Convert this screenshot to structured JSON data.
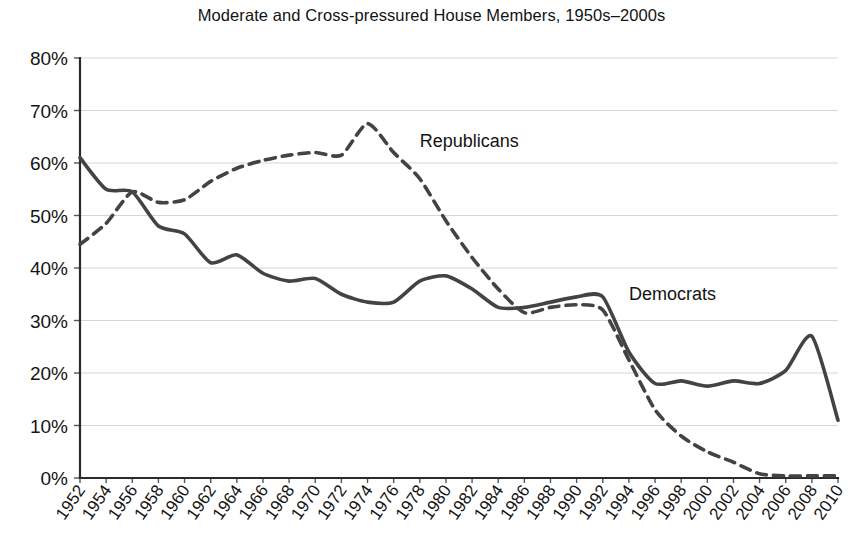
{
  "chart_data": {
    "type": "line",
    "title": "Moderate and Cross-pressured House Members, 1950s–2000s",
    "xlabel": "",
    "ylabel": "",
    "ylim": [
      0,
      80
    ],
    "ytick_labels": [
      "0%",
      "10%",
      "20%",
      "30%",
      "40%",
      "50%",
      "60%",
      "70%",
      "80%"
    ],
    "ytick_values": [
      0,
      10,
      20,
      30,
      40,
      50,
      60,
      70,
      80
    ],
    "grid": true,
    "legend_position": "inline-annotation",
    "x": [
      1952,
      1954,
      1956,
      1958,
      1960,
      1962,
      1964,
      1966,
      1968,
      1970,
      1972,
      1974,
      1976,
      1978,
      1980,
      1982,
      1984,
      1986,
      1988,
      1990,
      1992,
      1994,
      1996,
      1998,
      2000,
      2002,
      2004,
      2006,
      2008,
      2010
    ],
    "xtick_labels": [
      "1952",
      "1954",
      "1956",
      "1958",
      "1960",
      "1962",
      "1964",
      "1966",
      "1968",
      "1970",
      "1972",
      "1974",
      "1976",
      "1978",
      "1980",
      "1982",
      "1984",
      "1986",
      "1988",
      "1990",
      "1992",
      "1994",
      "1996",
      "1998",
      "2000",
      "2002",
      "2004",
      "2006",
      "2008",
      "2010"
    ],
    "series": [
      {
        "name": "Democrats",
        "style": "solid",
        "color": "#434343",
        "label_x": 1994,
        "label_y": 34,
        "values": [
          61,
          55,
          54.5,
          48,
          46.5,
          41,
          42.5,
          39,
          37.5,
          38,
          35,
          33.5,
          33.5,
          37.5,
          38.5,
          36,
          32.5,
          32.5,
          33.5,
          34.5,
          34.5,
          24,
          18,
          18.5,
          17.5,
          18.5,
          18,
          20.5,
          27,
          11
        ]
      },
      {
        "name": "Republicans",
        "style": "dashed",
        "color": "#434343",
        "label_x": 1978,
        "label_y": 63,
        "values": [
          44.5,
          48.5,
          54.5,
          52.5,
          53,
          56.5,
          59,
          60.5,
          61.5,
          62,
          61.5,
          67.5,
          62,
          57,
          49,
          42,
          36,
          31.5,
          32.5,
          33,
          32,
          22.5,
          13,
          8,
          5,
          3,
          0.8,
          0.4,
          0.4,
          0.4
        ]
      }
    ],
    "annotations": [
      {
        "text": "Republicans",
        "x": 1978,
        "y": 63
      },
      {
        "text": "Democrats",
        "x": 1994,
        "y": 34
      }
    ]
  },
  "plot_geometry": {
    "left": 80,
    "right": 838,
    "top": 58,
    "bottom": 478
  }
}
